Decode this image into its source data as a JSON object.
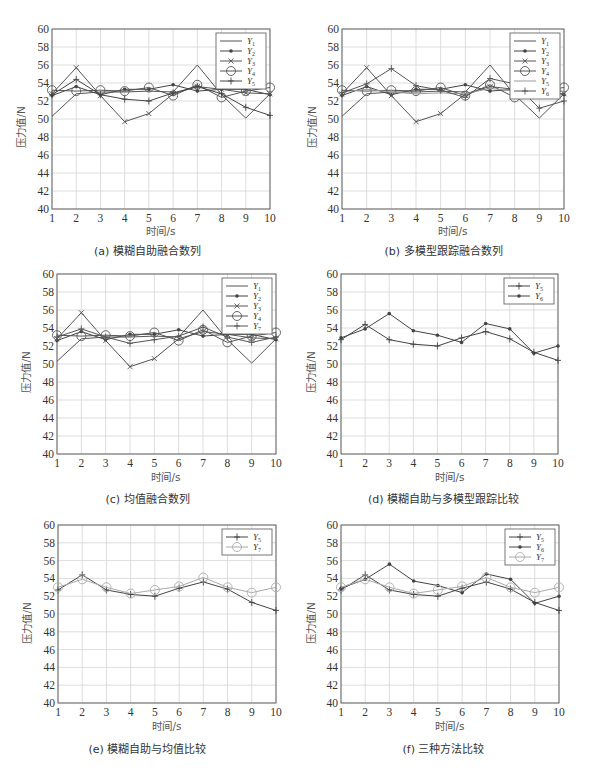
{
  "figure": {
    "ylabel": "压力值/N",
    "xlabel": "时间/s"
  },
  "panels": [
    {
      "id": "a",
      "caption": "(a) 模糊自助融合数列",
      "series_keys": [
        "Y1",
        "Y2",
        "Y3",
        "Y4",
        "Y5"
      ]
    },
    {
      "id": "b",
      "caption": "(b) 多模型跟踪融合数列",
      "series_keys": [
        "Y1",
        "Y2",
        "Y3",
        "Y4",
        "Y5",
        "Y6"
      ]
    },
    {
      "id": "c",
      "caption": "(c) 均值融合数列",
      "series_keys": [
        "Y1",
        "Y2",
        "Y3",
        "Y4",
        "Y7"
      ]
    },
    {
      "id": "d",
      "caption": "(d) 模糊自助与多模型跟踪比较",
      "series_keys": [
        "Y5",
        "Y6"
      ]
    },
    {
      "id": "e",
      "caption": "(e) 模糊自助与均值比较",
      "series_keys": [
        "Y5",
        "Y7"
      ]
    },
    {
      "id": "f",
      "caption": "(f) 三种方法比较",
      "series_keys": [
        "Y5",
        "Y6",
        "Y7"
      ]
    }
  ],
  "styles": {
    "Y1": {
      "marker": "none",
      "color": "#555555"
    },
    "Y2": {
      "marker": "dot",
      "color": "#444444"
    },
    "Y3": {
      "marker": "x",
      "color": "#555555"
    },
    "Y4": {
      "marker": "circle",
      "color": "#555555"
    },
    "Y5": {
      "marker": "plus",
      "color": "#444444"
    },
    "Y6": {
      "marker": "dot",
      "color": "#444444"
    },
    "Y7": {
      "marker": "circle",
      "color": "#aaaaaa"
    },
    "Y7_in_c": {
      "marker": "plus",
      "color": "#555555"
    },
    "Y6_in_b": {
      "marker": "plus",
      "color": "#555555"
    },
    "Y5_in_b": {
      "marker": "none",
      "color": "#999999"
    }
  },
  "chart_data": [
    {
      "type": "line",
      "title": "(a) 模糊自助融合数列",
      "xlabel": "时间/s",
      "ylabel": "压力值/N",
      "x": [
        1,
        2,
        3,
        4,
        5,
        6,
        7,
        8,
        9,
        10
      ],
      "xlim": [
        1,
        10
      ],
      "ylim": [
        40,
        60
      ],
      "yticks": [
        40,
        42,
        44,
        46,
        48,
        50,
        52,
        54,
        56,
        58,
        60
      ],
      "grid": true,
      "legend_position": "upper right",
      "series": [
        {
          "name": "Y1",
          "values": [
            50.3,
            52.8,
            53.0,
            53.0,
            53.1,
            53.0,
            56.0,
            52.7,
            50.1,
            52.8
          ]
        },
        {
          "name": "Y2",
          "values": [
            52.6,
            53.6,
            52.7,
            53.3,
            53.3,
            53.8,
            53.1,
            53.3,
            53.3,
            52.7
          ]
        },
        {
          "name": "Y3",
          "values": [
            52.8,
            55.7,
            52.6,
            49.7,
            50.6,
            52.8,
            53.6,
            53.3,
            52.9,
            52.8
          ]
        },
        {
          "name": "Y4",
          "values": [
            53.2,
            53.1,
            53.2,
            53.1,
            53.5,
            52.6,
            53.8,
            52.4,
            53.1,
            53.5
          ]
        },
        {
          "name": "Y5",
          "values": [
            52.7,
            54.4,
            52.7,
            52.2,
            52.0,
            52.9,
            53.6,
            52.8,
            51.3,
            50.4
          ]
        }
      ]
    },
    {
      "type": "line",
      "title": "(b) 多模型跟踪融合数列",
      "xlabel": "时间/s",
      "ylabel": "压力值/N",
      "x": [
        1,
        2,
        3,
        4,
        5,
        6,
        7,
        8,
        9,
        10
      ],
      "xlim": [
        1,
        10
      ],
      "ylim": [
        40,
        60
      ],
      "yticks": [
        40,
        42,
        44,
        46,
        48,
        50,
        52,
        54,
        56,
        58,
        60
      ],
      "grid": true,
      "legend_position": "upper right",
      "series": [
        {
          "name": "Y1",
          "values": [
            50.3,
            52.8,
            53.0,
            53.0,
            53.1,
            53.0,
            56.0,
            52.7,
            50.1,
            52.8
          ]
        },
        {
          "name": "Y2",
          "values": [
            52.6,
            53.6,
            52.7,
            53.3,
            53.3,
            53.8,
            53.1,
            53.3,
            53.3,
            52.7
          ]
        },
        {
          "name": "Y3",
          "values": [
            52.8,
            55.7,
            52.6,
            49.7,
            50.6,
            52.8,
            53.6,
            53.3,
            52.9,
            52.8
          ]
        },
        {
          "name": "Y4",
          "values": [
            53.2,
            53.1,
            53.2,
            53.1,
            53.5,
            52.6,
            53.8,
            52.4,
            53.1,
            53.5
          ]
        },
        {
          "name": "Y5",
          "values": [
            53.0,
            53.3,
            53.0,
            52.8,
            52.9,
            52.8,
            53.4,
            53.1,
            52.8,
            53.1
          ]
        },
        {
          "name": "Y6",
          "values": [
            52.9,
            53.9,
            55.6,
            53.7,
            53.2,
            52.4,
            54.5,
            53.9,
            51.2,
            52.0
          ]
        }
      ]
    },
    {
      "type": "line",
      "title": "(c) 均值融合数列",
      "xlabel": "时间/s",
      "ylabel": "压力值/N",
      "x": [
        1,
        2,
        3,
        4,
        5,
        6,
        7,
        8,
        9,
        10
      ],
      "xlim": [
        1,
        10
      ],
      "ylim": [
        40,
        60
      ],
      "yticks": [
        40,
        42,
        44,
        46,
        48,
        50,
        52,
        54,
        56,
        58,
        60
      ],
      "grid": true,
      "legend_position": "upper right",
      "series": [
        {
          "name": "Y1",
          "values": [
            50.3,
            52.8,
            53.0,
            53.0,
            53.1,
            53.0,
            56.0,
            52.7,
            50.1,
            52.8
          ]
        },
        {
          "name": "Y2",
          "values": [
            52.6,
            53.6,
            52.7,
            53.3,
            53.3,
            53.8,
            53.1,
            53.3,
            53.3,
            52.7
          ]
        },
        {
          "name": "Y3",
          "values": [
            52.8,
            55.7,
            52.6,
            49.7,
            50.6,
            52.8,
            53.6,
            53.3,
            52.9,
            52.8
          ]
        },
        {
          "name": "Y4",
          "values": [
            53.2,
            53.1,
            53.2,
            53.1,
            53.5,
            52.6,
            53.8,
            52.4,
            53.1,
            53.5
          ]
        },
        {
          "name": "Y7",
          "values": [
            53.0,
            53.9,
            53.0,
            52.3,
            52.7,
            53.1,
            54.1,
            53.0,
            52.4,
            53.0
          ]
        }
      ]
    },
    {
      "type": "line",
      "title": "(d) 模糊自助与多模型跟踪比较",
      "xlabel": "时间/s",
      "ylabel": "压力值/N",
      "x": [
        1,
        2,
        3,
        4,
        5,
        6,
        7,
        8,
        9,
        10
      ],
      "xlim": [
        1,
        10
      ],
      "ylim": [
        40,
        60
      ],
      "yticks": [
        40,
        42,
        44,
        46,
        48,
        50,
        52,
        54,
        56,
        58,
        60
      ],
      "grid": true,
      "legend_position": "upper right",
      "series": [
        {
          "name": "Y5",
          "values": [
            52.7,
            54.4,
            52.7,
            52.2,
            52.0,
            52.9,
            53.6,
            52.8,
            51.3,
            50.4
          ]
        },
        {
          "name": "Y6",
          "values": [
            52.9,
            53.9,
            55.6,
            53.7,
            53.2,
            52.4,
            54.5,
            53.9,
            51.2,
            52.0
          ]
        }
      ]
    },
    {
      "type": "line",
      "title": "(e) 模糊自助与均值比较",
      "xlabel": "时间/s",
      "ylabel": "压力值/N",
      "x": [
        1,
        2,
        3,
        4,
        5,
        6,
        7,
        8,
        9,
        10
      ],
      "xlim": [
        1,
        10
      ],
      "ylim": [
        40,
        60
      ],
      "yticks": [
        40,
        42,
        44,
        46,
        48,
        50,
        52,
        54,
        56,
        58,
        60
      ],
      "grid": true,
      "legend_position": "upper right",
      "series": [
        {
          "name": "Y5",
          "values": [
            52.7,
            54.4,
            52.7,
            52.2,
            52.0,
            52.9,
            53.6,
            52.8,
            51.3,
            50.4
          ]
        },
        {
          "name": "Y7",
          "values": [
            53.0,
            53.9,
            53.0,
            52.3,
            52.7,
            53.1,
            54.1,
            53.0,
            52.4,
            53.0
          ]
        }
      ]
    },
    {
      "type": "line",
      "title": "(f) 三种方法比较",
      "xlabel": "时间/s",
      "ylabel": "压力值/N",
      "x": [
        1,
        2,
        3,
        4,
        5,
        6,
        7,
        8,
        9,
        10
      ],
      "xlim": [
        1,
        10
      ],
      "ylim": [
        40,
        60
      ],
      "yticks": [
        40,
        42,
        44,
        46,
        48,
        50,
        52,
        54,
        56,
        58,
        60
      ],
      "grid": true,
      "legend_position": "upper right",
      "series": [
        {
          "name": "Y5",
          "values": [
            52.7,
            54.4,
            52.7,
            52.2,
            52.0,
            52.9,
            53.6,
            52.8,
            51.3,
            50.4
          ]
        },
        {
          "name": "Y6",
          "values": [
            52.9,
            53.9,
            55.6,
            53.7,
            53.2,
            52.4,
            54.5,
            53.9,
            51.2,
            52.0
          ]
        },
        {
          "name": "Y7",
          "values": [
            53.0,
            53.9,
            53.0,
            52.3,
            52.7,
            53.1,
            54.1,
            53.0,
            52.4,
            53.0
          ]
        }
      ]
    }
  ]
}
